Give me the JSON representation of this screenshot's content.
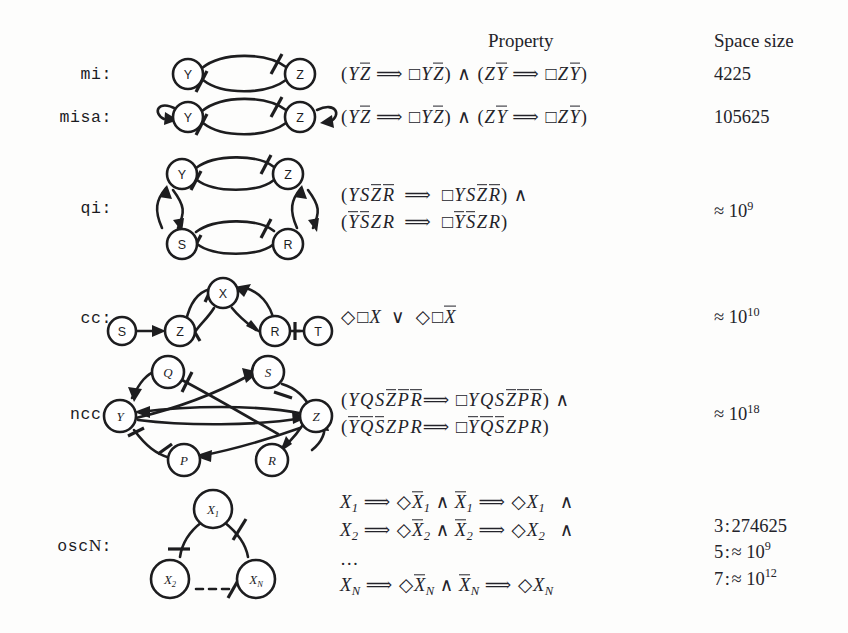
{
  "headers": {
    "property": "Property",
    "space_size": "Space size"
  },
  "rows": [
    {
      "name": "mi:",
      "diagram": "mi-graph",
      "property_lines": [
        "(Y Z̄ ⟹ □Y Z̄) ∧ (Z Ȳ ⟹ □Z Ȳ)"
      ],
      "space_size_lines": [
        "4225"
      ]
    },
    {
      "name": "misa:",
      "diagram": "misa-graph",
      "property_lines": [
        "(Y Z̄ ⟹ □Y Z̄) ∧ (Z Ȳ ⟹ □Z Ȳ)"
      ],
      "space_size_lines": [
        "105625"
      ]
    },
    {
      "name": "qi:",
      "diagram": "qi-graph",
      "property_lines": [
        "(Y S Z̄ R̄ ⟹ □Y S Z̄ R̄) ∧",
        "(Ȳ S̄ Z R ⟹ □Ȳ S̄ Z R)"
      ],
      "space_size_lines": [
        "≈ 10^9"
      ]
    },
    {
      "name": "cc:",
      "diagram": "cc-graph",
      "property_lines": [
        "◊□X ∨ ◊□X̄"
      ],
      "space_size_lines": [
        "≈ 10^10"
      ]
    },
    {
      "name": "ncc:",
      "diagram": "ncc-graph",
      "property_lines": [
        "(Y Q S Z̄ P̄ R̄ ⟹ □Y Q S Z̄ P̄ R̄) ∧",
        "(Ȳ Q̄ S̄ Z P R ⟹ □Ȳ Q̄ S̄ Z P R)"
      ],
      "space_size_lines": [
        "≈ 10^18"
      ]
    },
    {
      "name": "oscN:",
      "diagram": "oscn-graph",
      "property_lines": [
        "X₁ ⟹ ◊X̄₁ ∧ X̄₁ ⟹ ◊X₁   ∧",
        "X₂ ⟹ ◊X̄₂ ∧ X̄₂ ⟹ ◊X₂   ∧",
        "…",
        "X_N ⟹ ◊X̄_N ∧ X̄_N ⟹ ◊X_N"
      ],
      "space_size_lines": [
        "3 : 274625",
        "5 : ≈ 10^9",
        "7 : ≈ 10^12"
      ]
    }
  ],
  "diagrams": {
    "mi-graph": {
      "nodes": [
        "Y",
        "Z"
      ]
    },
    "misa-graph": {
      "nodes": [
        "Y",
        "Z"
      ]
    },
    "qi-graph": {
      "nodes": [
        "Y",
        "Z",
        "S",
        "R"
      ]
    },
    "cc-graph": {
      "nodes": [
        "S",
        "Z",
        "X",
        "R",
        "T"
      ]
    },
    "ncc-graph": {
      "nodes": [
        "Q",
        "S",
        "Y",
        "Z",
        "P",
        "R"
      ]
    },
    "oscn-graph": {
      "nodes": [
        "X1",
        "X2",
        "XN"
      ]
    }
  },
  "colors": {
    "ink": "#1d1d1f",
    "paper": "#fdfdfc"
  }
}
